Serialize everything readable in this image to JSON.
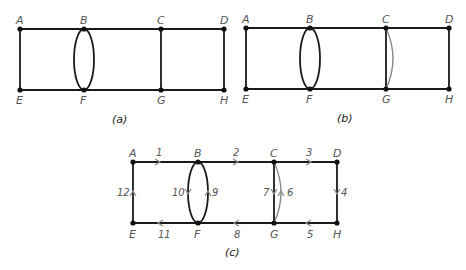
{
  "figure": {
    "panels": [
      {
        "id": "a",
        "caption": "(a)",
        "vertices": [
          {
            "label": "A",
            "x": 20,
            "y": 29
          },
          {
            "label": "B",
            "x": 84,
            "y": 29
          },
          {
            "label": "C",
            "x": 161,
            "y": 29
          },
          {
            "label": "D",
            "x": 224,
            "y": 29
          },
          {
            "label": "E",
            "x": 20,
            "y": 90
          },
          {
            "label": "F",
            "x": 84,
            "y": 90
          },
          {
            "label": "G",
            "x": 161,
            "y": 90
          },
          {
            "label": "H",
            "x": 224,
            "y": 90
          }
        ],
        "edges": [
          "A-B",
          "B-C",
          "C-D",
          "E-F",
          "F-G",
          "G-H",
          "A-E",
          "B-F (left arc)",
          "B-F (right arc)",
          "C-G",
          "D-H"
        ]
      },
      {
        "id": "b",
        "caption": "(b)",
        "vertices": [
          {
            "label": "A",
            "x": 246,
            "y": 28
          },
          {
            "label": "B",
            "x": 310,
            "y": 28
          },
          {
            "label": "C",
            "x": 386,
            "y": 28
          },
          {
            "label": "D",
            "x": 449,
            "y": 28
          },
          {
            "label": "E",
            "x": 246,
            "y": 89
          },
          {
            "label": "F",
            "x": 310,
            "y": 89
          },
          {
            "label": "G",
            "x": 386,
            "y": 89
          },
          {
            "label": "H",
            "x": 449,
            "y": 89
          }
        ],
        "edges": [
          "A-B",
          "B-C",
          "C-D",
          "E-F",
          "F-G",
          "G-H",
          "A-E",
          "B-F (left arc)",
          "B-F (right arc)",
          "C-G",
          "C-G (added gray arc)",
          "D-H"
        ]
      },
      {
        "id": "c",
        "caption": "(c)",
        "vertices": [
          {
            "label": "A",
            "x": 133,
            "y": 162
          },
          {
            "label": "B",
            "x": 198,
            "y": 162
          },
          {
            "label": "C",
            "x": 274,
            "y": 162
          },
          {
            "label": "D",
            "x": 337,
            "y": 162
          },
          {
            "label": "E",
            "x": 133,
            "y": 223
          },
          {
            "label": "F",
            "x": 198,
            "y": 223
          },
          {
            "label": "G",
            "x": 274,
            "y": 223
          },
          {
            "label": "H",
            "x": 337,
            "y": 223
          }
        ],
        "euler_circuit": [
          {
            "step": "1",
            "from": "A",
            "to": "B"
          },
          {
            "step": "2",
            "from": "B",
            "to": "C"
          },
          {
            "step": "3",
            "from": "C",
            "to": "D"
          },
          {
            "step": "4",
            "from": "D",
            "to": "H"
          },
          {
            "step": "5",
            "from": "H",
            "to": "G"
          },
          {
            "step": "6",
            "from": "G",
            "to": "C"
          },
          {
            "step": "7",
            "from": "C",
            "to": "G"
          },
          {
            "step": "8",
            "from": "G",
            "to": "F"
          },
          {
            "step": "9",
            "from": "F",
            "to": "B"
          },
          {
            "step": "10",
            "from": "B",
            "to": "F"
          },
          {
            "step": "11",
            "from": "F",
            "to": "E"
          },
          {
            "step": "12",
            "from": "E",
            "to": "A"
          }
        ]
      }
    ]
  }
}
